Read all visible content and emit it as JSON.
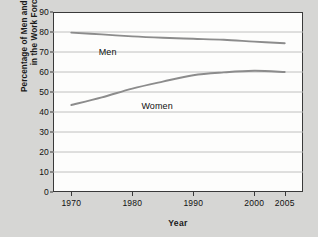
{
  "chart_data": {
    "type": "line",
    "title": "",
    "xlabel": "Year",
    "ylabel_line1": "Percentage of Men and Women",
    "ylabel_line2": "in the Work Force",
    "xlim": [
      1967,
      2008
    ],
    "ylim": [
      0,
      90
    ],
    "ytick_labels": [
      "90",
      "80",
      "70",
      "60",
      "50",
      "40",
      "30",
      "20",
      "10",
      "0"
    ],
    "ytick_values": [
      90,
      80,
      70,
      60,
      50,
      40,
      30,
      20,
      10,
      0
    ],
    "xtick_labels": [
      "1970",
      "1980",
      "1990",
      "2000",
      "2005"
    ],
    "xtick_values": [
      1970,
      1980,
      1990,
      2000,
      2005
    ],
    "grid": "horizontal",
    "legend_position": "inline-labels",
    "line_color": "#8c8c8c",
    "axis_color": "#3a3a3a",
    "plot_background": "#fdfdfc",
    "page_background": "#d6d6d4",
    "series": [
      {
        "name": "Men",
        "label": "Men",
        "label_x": 1974.5,
        "label_y": 72.5,
        "x": [
          1970,
          1975,
          1980,
          1985,
          1990,
          1995,
          2000,
          2005
        ],
        "values": [
          79.7,
          78.8,
          77.8,
          77.1,
          76.6,
          76.1,
          75.2,
          74.4
        ]
      },
      {
        "name": "Women",
        "label": "Women",
        "label_x": 1981.5,
        "label_y": 45.5,
        "x": [
          1970,
          1975,
          1980,
          1985,
          1990,
          1995,
          2000,
          2005
        ],
        "values": [
          43.5,
          47.3,
          51.7,
          55.2,
          58.4,
          59.8,
          60.6,
          60.0
        ]
      }
    ]
  }
}
